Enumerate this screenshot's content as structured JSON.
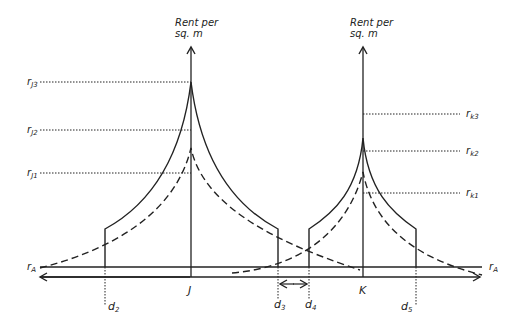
{
  "diagram": {
    "colors": {
      "line": "#222222",
      "background": "#ffffff"
    },
    "axis_titles": {
      "J": {
        "line1": "Rent per",
        "line2": "sq. m"
      },
      "K": {
        "line1": "Rent per",
        "line2": "sq. m"
      }
    },
    "centres": {
      "J": "J",
      "K": "K"
    },
    "rent_levels": {
      "rJ3": {
        "base": "r",
        "sub": "J3"
      },
      "rJ2": {
        "base": "r",
        "sub": "J2"
      },
      "rJ1": {
        "base": "r",
        "sub": "J1"
      },
      "rK3": {
        "base": "r",
        "sub": "k3"
      },
      "rK2": {
        "base": "r",
        "sub": "k2"
      },
      "rK1": {
        "base": "r",
        "sub": "k1"
      },
      "rA_left": {
        "base": "r",
        "sub": "A"
      },
      "rA_right": {
        "base": "r",
        "sub": "A"
      }
    },
    "distances": {
      "d2": {
        "base": "d",
        "sub": "2"
      },
      "d3": {
        "base": "d",
        "sub": "3"
      },
      "d4": {
        "base": "d",
        "sub": "4"
      },
      "d5": {
        "base": "d",
        "sub": "5"
      }
    },
    "legend": {
      "solid": "Bid-rent curve (higher)",
      "dashed": "Bid-rent curve (lower)"
    }
  }
}
